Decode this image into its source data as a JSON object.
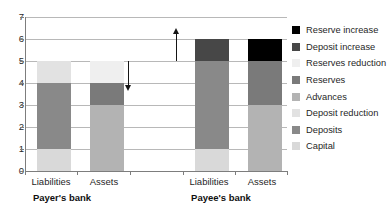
{
  "chart_data": {
    "type": "bar",
    "subtype": "stacked",
    "title": "",
    "xlabel": "",
    "ylabel": "",
    "ylim": [
      0,
      7
    ],
    "ytick_labels": [
      "0",
      "1",
      "2",
      "3",
      "4",
      "5",
      "6",
      "7"
    ],
    "ytick_values": [
      0,
      1,
      2,
      3,
      4,
      5,
      6,
      7
    ],
    "grid": true,
    "legend_position": "right",
    "groups": [
      {
        "name": "Payer's bank",
        "categories": [
          "Liabilities",
          "Assets"
        ]
      },
      {
        "name": "Payee's bank",
        "categories": [
          "Liabilities",
          "Assets"
        ]
      }
    ],
    "categories": [
      "Liabilities",
      "Assets",
      "Liabilities",
      "Assets"
    ],
    "series": [
      {
        "name": "Capital",
        "color": "#d9d9d9",
        "values": [
          1,
          0,
          1,
          0
        ]
      },
      {
        "name": "Deposits",
        "color": "#898989",
        "values": [
          3,
          0,
          4,
          0
        ]
      },
      {
        "name": "Deposit reduction",
        "color": "#e2e2e2",
        "values": [
          1,
          0,
          0,
          0
        ]
      },
      {
        "name": "Advances",
        "color": "#b3b3b3",
        "values": [
          0,
          3,
          0,
          3
        ]
      },
      {
        "name": "Reserves",
        "color": "#7a7a7a",
        "values": [
          0,
          1,
          0,
          2
        ]
      },
      {
        "name": "Reserves reduction",
        "color": "#efefef",
        "values": [
          0,
          1,
          0,
          0
        ]
      },
      {
        "name": "Deposit increase",
        "color": "#474747",
        "values": [
          0,
          0,
          1,
          0
        ]
      },
      {
        "name": "Reserve increase",
        "color": "#000000",
        "values": [
          0,
          0,
          0,
          1
        ]
      }
    ],
    "bar_totals": [
      5,
      5,
      6,
      6
    ],
    "annotations": [
      {
        "name": "deposit-reduction-arrow",
        "type": "arrow",
        "direction": "down",
        "from": 5,
        "to": 4
      },
      {
        "name": "deposit-increase-arrow",
        "type": "arrow",
        "direction": "up",
        "from": 5,
        "to": 6
      }
    ]
  },
  "legend": {
    "items": [
      {
        "label": "Reserve increase",
        "color": "#000000"
      },
      {
        "label": "Deposit increase",
        "color": "#474747"
      },
      {
        "label": "Reserves reduction",
        "color": "#efefef"
      },
      {
        "label": "Reserves",
        "color": "#7a7a7a"
      },
      {
        "label": "Advances",
        "color": "#b3b3b3"
      },
      {
        "label": "Deposit reduction",
        "color": "#e2e2e2"
      },
      {
        "label": "Deposits",
        "color": "#898989"
      },
      {
        "label": "Capital",
        "color": "#d9d9d9"
      }
    ]
  },
  "axis": {
    "y_labels": [
      "7",
      "6",
      "5",
      "4",
      "3",
      "2",
      "1",
      "0"
    ]
  },
  "x_labels": {
    "payer_liabilities": "Liabilities",
    "payer_assets": "Assets",
    "payee_liabilities": "Liabilities",
    "payee_assets": "Assets",
    "payer_group": "Payer's bank",
    "payee_group": "Payee's bank"
  }
}
